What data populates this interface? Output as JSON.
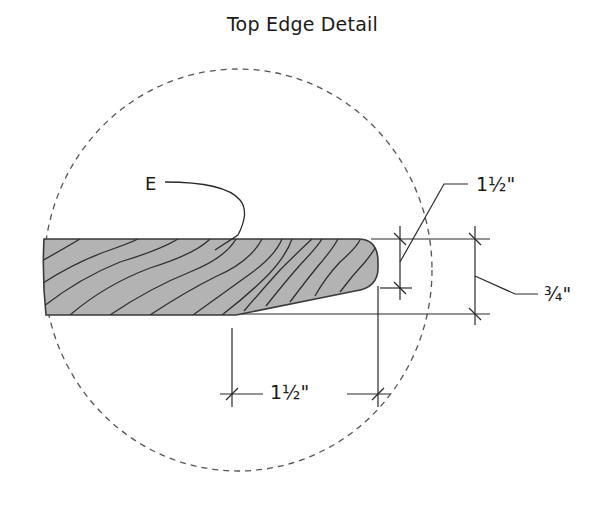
{
  "title": "Top Edge Detail",
  "callouts": {
    "part_label": "E"
  },
  "dimensions": {
    "nose_height": "1½\"",
    "board_thickness": "¾\"",
    "taper_length": "1½\""
  },
  "colors": {
    "board_fill": "#b3b3b3",
    "line": "#2a2a2a",
    "detail_circle": "#555555",
    "background": "#ffffff"
  },
  "detail_circle": {
    "style": "dashed",
    "cx": 238,
    "cy": 270,
    "rx": 194,
    "ry": 201
  }
}
